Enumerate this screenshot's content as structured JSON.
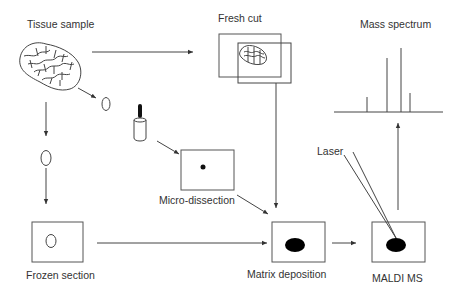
{
  "labels": {
    "tissue_sample": "Tissue sample",
    "fresh_cut": "Fresh cut",
    "mass_spectrum": "Mass spectrum",
    "micro_dissection": "Micro-dissection",
    "laser": "Laser",
    "frozen_section": "Frozen section",
    "matrix_deposition": "Matrix deposition",
    "maldi_ms": "MALDI MS"
  },
  "colors": {
    "line": "#444444",
    "text": "#333333",
    "fill": "#000000",
    "background": "#ffffff"
  },
  "flow": [
    {
      "from": "Tissue sample",
      "to": "Fresh cut"
    },
    {
      "from": "Tissue sample",
      "to": "Frozen section"
    },
    {
      "from": "Tissue sample",
      "to": "Micro-dissection"
    },
    {
      "from": "Fresh cut",
      "to": "Matrix deposition"
    },
    {
      "from": "Micro-dissection",
      "to": "Matrix deposition"
    },
    {
      "from": "Frozen section",
      "to": "Matrix deposition"
    },
    {
      "from": "Matrix deposition",
      "to": "MALDI MS"
    },
    {
      "from": "MALDI MS",
      "to": "Mass spectrum"
    }
  ]
}
